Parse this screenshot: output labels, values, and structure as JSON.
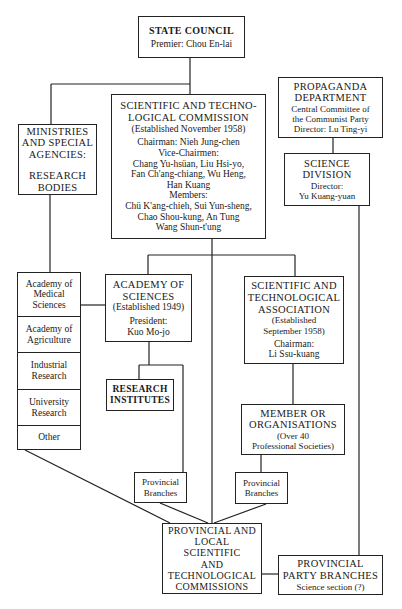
{
  "diagram": {
    "type": "organizational-chart",
    "nodes": {
      "state_council": {
        "title": "STATE COUNCIL",
        "line1": "Premier: Chou En-lai"
      },
      "commission": {
        "title1": "SCIENTIFIC AND TECHNO-",
        "title2": "LOGICAL COMMISSION",
        "established": "(Established November 1958)",
        "chairman": "Chairman: Nieh Jung-chen",
        "vice_label": "Vice-Chairmen:",
        "vice1": "Chang Yu-hsüan, Liu Hsi-yo,",
        "vice2": "Fan Ch'ang-chiang, Wu Heng,",
        "vice3": "Han Kuang",
        "members_label": "Members:",
        "members1": "Chü K'ang-chieh, Sui Yun-sheng,",
        "members2": "Chao Shou-kung, An Tung",
        "members3": "Wang Shun-t'ung"
      },
      "ministries": {
        "title1": "MINISTRIES",
        "title2": "AND SPECIAL",
        "title3": "AGENCIES:",
        "title4": "RESEARCH",
        "title5": "BODIES"
      },
      "propaganda": {
        "title1": "PROPAGANDA",
        "title2": "DEPARTMENT",
        "line1": "Central Committee of",
        "line2": "the Communist Party",
        "line3": "Director: Lu Ting-yi"
      },
      "science_division": {
        "title1": "SCIENCE",
        "title2": "DIVISION",
        "line1": "Director:",
        "line2": "Yu Kuang-yuan"
      },
      "research_bodies": [
        {
          "line1": "Academy of",
          "line2": "Medical",
          "line3": "Sciences"
        },
        {
          "line1": "Academy of",
          "line2": "Agriculture"
        },
        {
          "line1": "Industrial",
          "line2": "Research"
        },
        {
          "line1": "University",
          "line2": "Research"
        },
        {
          "line1": "Other"
        }
      ],
      "academy": {
        "title1": "ACADEMY OF",
        "title2": "SCIENCES",
        "established": "(Established 1949)",
        "line1": "President:",
        "line2": "Kuo Mo-jo"
      },
      "association": {
        "title1": "SCIENTIFIC AND",
        "title2": "TECHNOLOGICAL",
        "title3": "ASSOCIATION",
        "est1": "(Established",
        "est2": "September 1958)",
        "line1": "Chairman:",
        "line2": "Li Ssu-kuang"
      },
      "institutes": {
        "title1": "RESEARCH",
        "title2": "INSTITUTES"
      },
      "member_orgs": {
        "title1": "MEMBER OR",
        "title2": "ORGANISATIONS",
        "line1": "(Over 40",
        "line2": "Professional Societies)"
      },
      "prov_branches_left": {
        "line1": "Provincial",
        "line2": "Branches"
      },
      "prov_branches_right": {
        "line1": "Provincial",
        "line2": "Branches"
      },
      "provincial_local": {
        "line1": "PROVINCIAL AND",
        "line2": "LOCAL",
        "line3": "SCIENTIFIC",
        "line4": "AND",
        "line5": "TECHNOLOGICAL",
        "line6": "COMMISSIONS"
      },
      "party_branches": {
        "title1": "PROVINCIAL",
        "title2": "PARTY BRANCHES",
        "line1": "Science section (?)"
      }
    },
    "edges": [
      [
        "state_council",
        "commission"
      ],
      [
        "state_council",
        "ministries"
      ],
      [
        "propaganda",
        "science_division"
      ],
      [
        "science_division",
        "party_branches"
      ],
      [
        "ministries",
        "research_bodies"
      ],
      [
        "research_bodies",
        "academy"
      ],
      [
        "commission",
        "academy"
      ],
      [
        "commission",
        "association"
      ],
      [
        "commission",
        "provincial_local"
      ],
      [
        "academy",
        "institutes"
      ],
      [
        "academy",
        "prov_branches_left"
      ],
      [
        "association",
        "member_orgs"
      ],
      [
        "member_orgs",
        "prov_branches_right"
      ],
      [
        "research_bodies",
        "provincial_local"
      ],
      [
        "prov_branches_left",
        "provincial_local"
      ],
      [
        "prov_branches_right",
        "provincial_local"
      ],
      [
        "provincial_local",
        "party_branches"
      ]
    ],
    "colors": {
      "line": "#222222",
      "background": "#ffffff",
      "text": "#1a1a1a"
    }
  }
}
